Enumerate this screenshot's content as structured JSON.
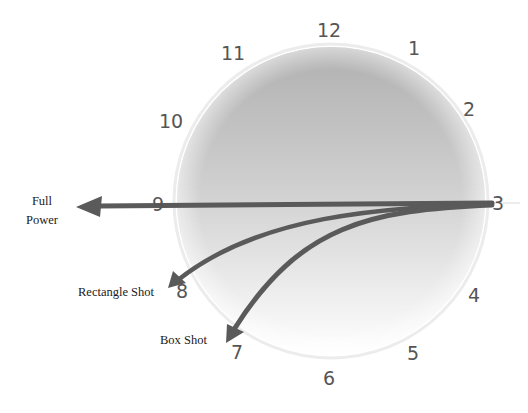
{
  "diagram": {
    "type": "clock-face-shot-directions",
    "clock_numbers": [
      {
        "n": "12",
        "x": 329,
        "y": 30
      },
      {
        "n": "1",
        "x": 414,
        "y": 48
      },
      {
        "n": "2",
        "x": 469,
        "y": 109
      },
      {
        "n": "3",
        "x": 498,
        "y": 203
      },
      {
        "n": "4",
        "x": 474,
        "y": 295
      },
      {
        "n": "5",
        "x": 413,
        "y": 353
      },
      {
        "n": "6",
        "x": 329,
        "y": 378
      },
      {
        "n": "7",
        "x": 237,
        "y": 352
      },
      {
        "n": "8",
        "x": 182,
        "y": 291
      },
      {
        "n": "9",
        "x": 158,
        "y": 204
      },
      {
        "n": "10",
        "x": 171,
        "y": 121
      },
      {
        "n": "11",
        "x": 233,
        "y": 53
      }
    ],
    "arrows": [
      {
        "name": "full-power",
        "label": "Full Power",
        "from": "3",
        "to": "9"
      },
      {
        "name": "rectangle-shot",
        "label": "Rectangle Shot",
        "from": "3",
        "to": "8"
      },
      {
        "name": "box-shot",
        "label": "Box Shot",
        "from": "3",
        "to": "7"
      }
    ],
    "labels": {
      "full_power_line1": "Full",
      "full_power_line2": "Power",
      "rectangle_shot": "Rectangle Shot",
      "box_shot": "Box Shot"
    },
    "colors": {
      "arrow": "#5a5a5a",
      "circle_top": "#b3b3b3",
      "circle_bottom": "#ffffff",
      "number": "#555555"
    }
  }
}
